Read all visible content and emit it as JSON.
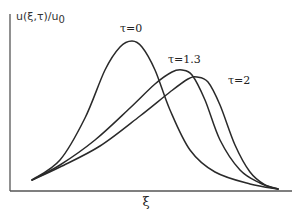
{
  "chart_data": {
    "type": "line",
    "title": "",
    "xlabel": "ξ",
    "ylabel": "u(ξ,τ)/u0",
    "ylabel_main": "u(ξ,τ)/u",
    "ylabel_sub": "0",
    "grid": false,
    "legend_position": "inline annotations near each curve peak",
    "x_ticks": [],
    "y_ticks": [],
    "series": [
      {
        "name": "τ=0",
        "label_pos": [
          120,
          32
        ],
        "points": [
          [
            32,
            180
          ],
          [
            60,
            160
          ],
          [
            85,
            118
          ],
          [
            105,
            70
          ],
          [
            120,
            47
          ],
          [
            132,
            41
          ],
          [
            142,
            47
          ],
          [
            155,
            70
          ],
          [
            170,
            110
          ],
          [
            190,
            150
          ],
          [
            215,
            172
          ],
          [
            250,
            184
          ],
          [
            278,
            189
          ]
        ]
      },
      {
        "name": "τ=1.3",
        "label_pos": [
          168,
          63
        ],
        "points": [
          [
            32,
            180
          ],
          [
            60,
            165
          ],
          [
            95,
            140
          ],
          [
            130,
            108
          ],
          [
            155,
            84
          ],
          [
            172,
            72
          ],
          [
            182,
            70
          ],
          [
            192,
            75
          ],
          [
            205,
            100
          ],
          [
            220,
            140
          ],
          [
            240,
            170
          ],
          [
            260,
            183
          ],
          [
            278,
            189
          ]
        ]
      },
      {
        "name": "τ=2",
        "label_pos": [
          228,
          84
        ],
        "points": [
          [
            32,
            180
          ],
          [
            60,
            167
          ],
          [
            100,
            146
          ],
          [
            140,
            116
          ],
          [
            170,
            92
          ],
          [
            188,
            79
          ],
          [
            197,
            77
          ],
          [
            208,
            82
          ],
          [
            220,
            105
          ],
          [
            235,
            145
          ],
          [
            250,
            172
          ],
          [
            265,
            185
          ],
          [
            278,
            189
          ]
        ]
      }
    ]
  },
  "axes": {
    "origin": [
      10,
      191
    ],
    "y_top": 14,
    "x_right": 292
  }
}
